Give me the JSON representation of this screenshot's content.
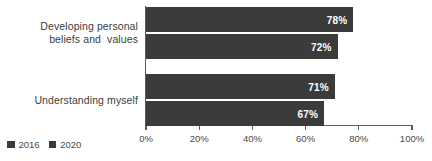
{
  "chart_data": {
    "type": "bar",
    "orientation": "horizontal",
    "title": "",
    "subtitle": "",
    "xlabel": "",
    "ylabel": "",
    "categories": [
      "Developing personal\nbeliefs and  values",
      "Understanding myself"
    ],
    "series": [
      {
        "name": "2016",
        "values": [
          78,
          72
        ],
        "color": "#3b3b3b"
      },
      {
        "name": "2020",
        "values": [
          71,
          67
        ],
        "color": "#3b3b3b"
      }
    ],
    "bars": [
      {
        "category_index": 0,
        "series": "2016",
        "value": 78,
        "label": "78%"
      },
      {
        "category_index": 0,
        "series": "2020",
        "value": 72,
        "label": "72%"
      },
      {
        "category_index": 1,
        "series": "2016",
        "value": 71,
        "label": "71%"
      },
      {
        "category_index": 1,
        "series": "2020",
        "value": 67,
        "label": "67%"
      }
    ],
    "value_suffix": "%",
    "xlim": [
      0,
      100
    ],
    "xticks": [
      0,
      20,
      40,
      60,
      80,
      100
    ],
    "xtick_labels": [
      "0%",
      "20%",
      "40%",
      "60%",
      "80%",
      "100%"
    ],
    "grid": false,
    "legend_position": "bottom-left"
  },
  "legend": {
    "items": [
      {
        "label": "2016",
        "color": "#3b3b3b"
      },
      {
        "label": "2020",
        "color": "#3b3b3b"
      }
    ]
  },
  "colors": {
    "bar": "#3b3b3b",
    "axis": "#5b5b5b",
    "text": "#404040",
    "value_text": "#ffffff",
    "background": "#ffffff"
  }
}
